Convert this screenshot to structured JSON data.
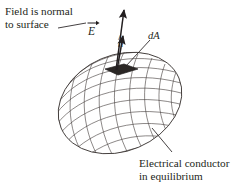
{
  "figure": {
    "background_color": "#ffffff",
    "ink_color": "#231f20",
    "mesh_color": "#3f3a38",
    "patch_fill_color": "#2b2725"
  },
  "annotations": {
    "field_normal": {
      "line1": "Field is normal",
      "line2": "to surface"
    },
    "conductor": {
      "line1": "Electrical conductor",
      "line2": "in equilibrium"
    }
  },
  "symbols": {
    "field_vector": "E",
    "field_vector_accent": "arrow",
    "normal_vector": "n",
    "normal_vector_accent": "hat",
    "area_element": "dA"
  },
  "objects": {
    "conductor_shape": "ellipsoid-wireframe",
    "area_patch": "dA-surface-element",
    "vectors": [
      {
        "name": "E",
        "description": "electric field vector normal to surface"
      },
      {
        "name": "n-hat",
        "description": "unit normal vector to surface element"
      }
    ],
    "leader_lines": [
      {
        "name": "field-normal-leader",
        "from": "field-normal-label",
        "to": "E-symbol"
      },
      {
        "name": "dA-leader",
        "from": "dA-symbol",
        "to": "area-patch"
      },
      {
        "name": "conductor-leader",
        "from": "conductor-label",
        "to": "ellipsoid-surface"
      }
    ]
  }
}
